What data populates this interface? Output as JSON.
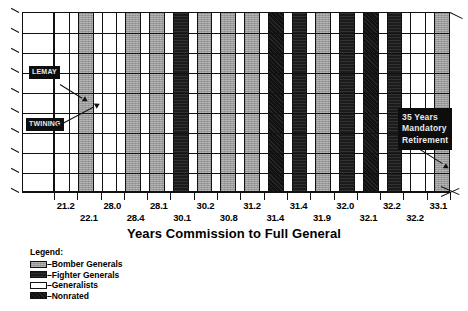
{
  "chart_data": {
    "type": "bar",
    "title": "",
    "xlabel": "Years Commission to Full General",
    "ylabel": "",
    "grid": true,
    "legend_position": "bottom-left",
    "tick_labels_row1": [
      "21.2",
      "28.0",
      "28.1",
      "30.2",
      "31.2",
      "31.4",
      "32.0",
      "32.2",
      "33.1"
    ],
    "tick_labels_row2": [
      "22.1",
      "28.4",
      "30.1",
      "30.8",
      "31.4",
      "31.9",
      "32.1",
      "32.2"
    ],
    "categories": [
      "21.2",
      "22.1",
      "28.0",
      "28.4",
      "28.1",
      "30.1",
      "30.2",
      "30.8",
      "31.2",
      "31.4",
      "31.4",
      "31.9",
      "32.0",
      "32.1",
      "32.2",
      "32.2",
      "33.1"
    ],
    "series": [
      {
        "name": "Years Commission to Full General",
        "values": [
          21.2,
          22.1,
          28.0,
          28.4,
          28.1,
          30.1,
          30.2,
          30.8,
          31.2,
          31.4,
          31.4,
          31.9,
          32.0,
          32.1,
          32.2,
          32.2,
          33.1
        ]
      }
    ],
    "bars": [
      {
        "value": "21.2",
        "category": "Generalists"
      },
      {
        "value": "22.1",
        "category": "Bomber Generals"
      },
      {
        "value": "28.0",
        "category": "Generalists"
      },
      {
        "value": "28.4",
        "category": "Bomber Generals"
      },
      {
        "value": "28.1",
        "category": "Bomber Generals"
      },
      {
        "value": "30.1",
        "category": "Fighter Generals"
      },
      {
        "value": "30.2",
        "category": "Bomber Generals"
      },
      {
        "value": "30.8",
        "category": "Bomber Generals"
      },
      {
        "value": "31.2",
        "category": "Bomber Generals"
      },
      {
        "value": "31.4",
        "category": "Nonrated"
      },
      {
        "value": "31.4",
        "category": "Fighter Generals"
      },
      {
        "value": "31.9",
        "category": "Bomber Generals"
      },
      {
        "value": "32.0",
        "category": "Fighter Generals"
      },
      {
        "value": "32.1",
        "category": "Nonrated"
      },
      {
        "value": "32.2",
        "category": "Fighter Generals"
      },
      {
        "value": "32.2",
        "category": "Generalists"
      },
      {
        "value": "33.1",
        "category": "Bomber Generals"
      }
    ],
    "annotations": [
      {
        "id": "lemay",
        "text": "LEMAY",
        "points_to": "22.1"
      },
      {
        "id": "twining",
        "text": "TWINING",
        "points_to": "28.0"
      },
      {
        "id": "retirement",
        "text": "35 Years\nMandatory\nRetirement",
        "points_to": "right-axis-end"
      }
    ]
  },
  "legend": {
    "title": "Legend:",
    "items": [
      {
        "label": "–Bomber Generals",
        "color": "#9b9b9b",
        "swatch": "bomber"
      },
      {
        "label": "–Fighter Generals",
        "color": "#1b1b1b",
        "swatch": "fighter"
      },
      {
        "label": "–Generalists",
        "color": "#ffffff",
        "swatch": "generalist"
      },
      {
        "label": "–Nonrated",
        "color": "#111111",
        "swatch": "nonrated"
      }
    ]
  },
  "colors": {
    "bomber": "#9b9b9b",
    "fighter": "#1b1b1b",
    "generalist": "#ffffff",
    "nonrated": "#111111",
    "outline": "#111111",
    "callout_bg": "#0d0d0d",
    "callout_fg": "#e8e8e8",
    "page_bg": "#ffffff"
  }
}
